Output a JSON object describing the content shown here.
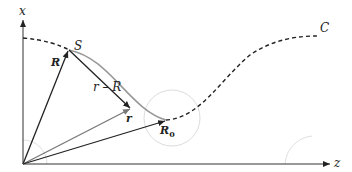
{
  "diagram": {
    "axes": {
      "vertical_label": "x",
      "horizontal_label": "z"
    },
    "points": {
      "source": "S",
      "field_point": "r",
      "reference_point": "R",
      "curve_label": "C"
    },
    "vectors": {
      "R": "R",
      "r": "r",
      "r_minus_R": "r – R",
      "R0_base": "R",
      "R0_sub": "0"
    },
    "colors": {
      "dark_line": "#222222",
      "gray_line": "#777777",
      "light_circle": "#d9d9d9",
      "smooth_curve": "#999999"
    }
  }
}
